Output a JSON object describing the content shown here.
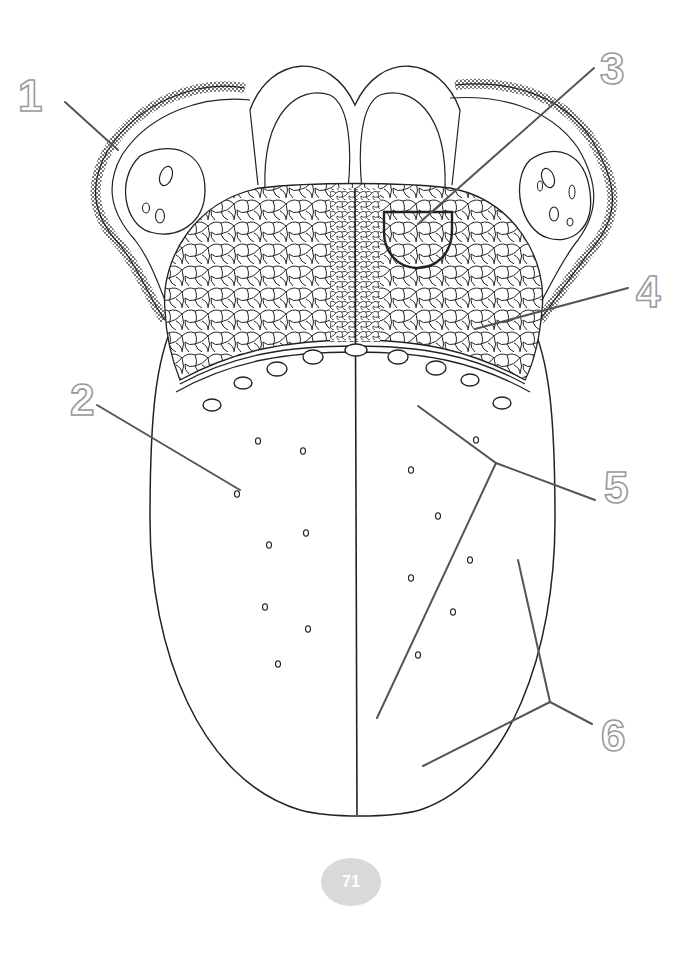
{
  "diagram": {
    "labels": [
      {
        "number": "1",
        "x": 18,
        "y": 78
      },
      {
        "number": "2",
        "x": 70,
        "y": 382
      },
      {
        "number": "3",
        "x": 612,
        "y": 58
      },
      {
        "number": "4",
        "x": 636,
        "y": 274
      },
      {
        "number": "5",
        "x": 606,
        "y": 470
      },
      {
        "number": "6",
        "x": 604,
        "y": 718
      }
    ],
    "colors": {
      "outline": "#222222",
      "leader_line": "#555555",
      "label_stroke": "#9a9a9a",
      "page_badge": "#d9d9d9"
    }
  },
  "footer": {
    "page_number": "71"
  }
}
